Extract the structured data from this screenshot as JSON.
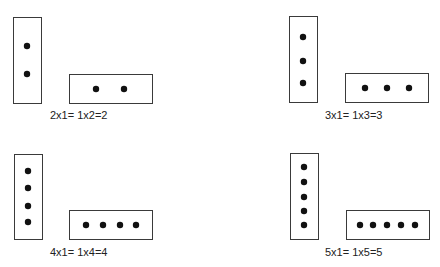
{
  "figure": {
    "panels": [
      {
        "n": 2,
        "equation": "2 x1 = 1 x 2 = 2",
        "vertical": {
          "x": 13,
          "y": 17,
          "w": 28,
          "h": 86,
          "dots": [
            [
              27,
              46
            ],
            [
              27,
              74
            ]
          ]
        },
        "horizontal": {
          "x": 69,
          "y": 74,
          "w": 83,
          "h": 29,
          "dots": [
            [
              96,
              89
            ],
            [
              124,
              89
            ]
          ]
        },
        "label_pos": [
          50,
          119
        ]
      },
      {
        "n": 3,
        "equation": "3 x1 = 1 x 3 = 3",
        "vertical": {
          "x": 289,
          "y": 16,
          "w": 28,
          "h": 86,
          "dots": [
            [
              303,
              37
            ],
            [
              303,
              61
            ],
            [
              303,
              83
            ]
          ]
        },
        "horizontal": {
          "x": 345,
          "y": 73,
          "w": 83,
          "h": 29,
          "dots": [
            [
              365,
              88
            ],
            [
              387,
              88
            ],
            [
              409,
              88
            ]
          ]
        },
        "label_pos": [
          325,
          119
        ]
      },
      {
        "n": 4,
        "equation": "4 x1 = 1 x 4 = 4",
        "vertical": {
          "x": 14,
          "y": 154,
          "w": 28,
          "h": 85,
          "dots": [
            [
              28,
              171
            ],
            [
              28,
              188
            ],
            [
              28,
              206
            ],
            [
              28,
              222
            ]
          ]
        },
        "horizontal": {
          "x": 69,
          "y": 210,
          "w": 83,
          "h": 29,
          "dots": [
            [
              86,
              225
            ],
            [
              103,
              225
            ],
            [
              120,
              225
            ],
            [
              136,
              225
            ]
          ]
        },
        "label_pos": [
          50,
          256
        ]
      },
      {
        "n": 5,
        "equation": "5 x1 = 1 x 5 = 5",
        "vertical": {
          "x": 290,
          "y": 153,
          "w": 28,
          "h": 86,
          "dots": [
            [
              304,
              167
            ],
            [
              304,
              182
            ],
            [
              304,
              197
            ],
            [
              304,
              211
            ],
            [
              304,
              225
            ]
          ]
        },
        "horizontal": {
          "x": 346,
          "y": 210,
          "w": 83,
          "h": 29,
          "dots": [
            [
              360,
              225
            ],
            [
              373,
              225
            ],
            [
              387,
              225
            ],
            [
              401,
              225
            ],
            [
              415,
              225
            ]
          ]
        },
        "label_pos": [
          325,
          256
        ]
      }
    ],
    "colors": {
      "stroke": "#3a3a3a",
      "dot": "#111111",
      "text": "#222222",
      "background": "#ffffff"
    }
  }
}
